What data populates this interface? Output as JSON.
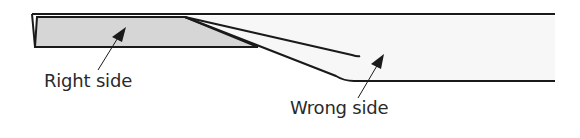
{
  "diagram": {
    "labels": {
      "right_side": "Right side",
      "wrong_side": "Wrong side"
    },
    "colors": {
      "stroke": "#1a1a1a",
      "right_side_fill": "#d6d6d6",
      "wrong_side_fill": "#f7f7f7",
      "background": "#ffffff",
      "text": "#2a2a2a"
    }
  }
}
